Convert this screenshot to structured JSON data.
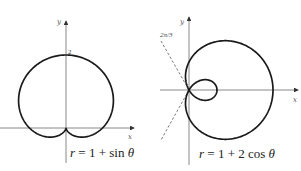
{
  "panels": [
    {
      "id": "left",
      "equation": "r = 1 + sin θ",
      "axis_x_label": "x",
      "axis_y_label": "y",
      "tick_label": "2",
      "origin": [
        66,
        128
      ],
      "scale": 36.5,
      "curve": "1+sin"
    },
    {
      "id": "right",
      "equation": "r = 1 + 2 cos θ",
      "axis_x_label": "x",
      "axis_y_label": "y",
      "angle_label": "2π/3",
      "origin": [
        189,
        90
      ],
      "scale": 28,
      "curve": "1+2cos"
    }
  ],
  "colors": {
    "curve": "#1a1a1a",
    "axis": "#6b6b6b",
    "background": "#ffffff"
  }
}
